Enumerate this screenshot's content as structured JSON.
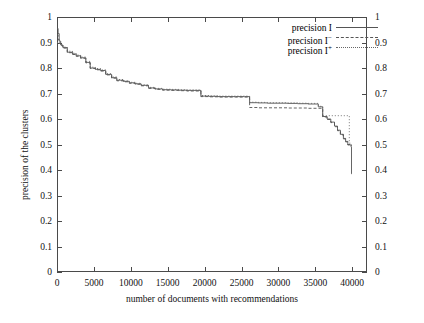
{
  "chart_data": {
    "type": "line",
    "title": "",
    "subtitle": "",
    "xlabel": "number of documents with recommendations",
    "ylabel": "precision of the clusters",
    "xlim": [
      0,
      42000
    ],
    "ylim": [
      0,
      1
    ],
    "xticks": [
      0,
      5000,
      10000,
      15000,
      20000,
      25000,
      30000,
      35000,
      40000
    ],
    "xtick_labels": [
      "0",
      "5000",
      "10000",
      "15000",
      "20000",
      "25000",
      "30000",
      "35000",
      "40000"
    ],
    "yticks": [
      0,
      0.1,
      0.2,
      0.3,
      0.4,
      0.5,
      0.6,
      0.7,
      0.8,
      0.9,
      1
    ],
    "ytick_labels": [
      "0",
      "0.1",
      "0.2",
      "0.3",
      "0.4",
      "0.5",
      "0.6",
      "0.7",
      "0.8",
      "0.9",
      "1"
    ],
    "right_axis_mirrored": true,
    "right_ytick_labels": [
      "0",
      "0.1",
      "0.2",
      "0.3",
      "0.4",
      "0.5",
      "0.6",
      "0.7",
      "0.8",
      "0.9",
      "1"
    ],
    "grid": false,
    "legend_position": "top-right",
    "step_style": "post",
    "series": [
      {
        "name": "precision I",
        "label_base": "precision I",
        "label_sup": "",
        "dash": "solid",
        "color": "#555555",
        "points": [
          [
            0,
            0.955
          ],
          [
            150,
            0.935
          ],
          [
            300,
            0.905
          ],
          [
            500,
            0.89
          ],
          [
            800,
            0.88
          ],
          [
            1400,
            0.862
          ],
          [
            2100,
            0.855
          ],
          [
            2600,
            0.848
          ],
          [
            3200,
            0.84
          ],
          [
            3900,
            0.822
          ],
          [
            4500,
            0.8
          ],
          [
            5200,
            0.795
          ],
          [
            5900,
            0.79
          ],
          [
            6600,
            0.775
          ],
          [
            7400,
            0.762
          ],
          [
            8100,
            0.752
          ],
          [
            9000,
            0.748
          ],
          [
            9800,
            0.742
          ],
          [
            10600,
            0.738
          ],
          [
            11400,
            0.732
          ],
          [
            12400,
            0.722
          ],
          [
            13300,
            0.718
          ],
          [
            14300,
            0.715
          ],
          [
            15400,
            0.714
          ],
          [
            16500,
            0.713
          ],
          [
            17600,
            0.712
          ],
          [
            18700,
            0.712
          ],
          [
            19500,
            0.69
          ],
          [
            20600,
            0.689
          ],
          [
            21800,
            0.688
          ],
          [
            23000,
            0.688
          ],
          [
            24200,
            0.688
          ],
          [
            25400,
            0.688
          ],
          [
            26100,
            0.664
          ],
          [
            27200,
            0.663
          ],
          [
            28500,
            0.662
          ],
          [
            29800,
            0.662
          ],
          [
            31200,
            0.661
          ],
          [
            32600,
            0.66
          ],
          [
            34000,
            0.659
          ],
          [
            35400,
            0.648
          ],
          [
            36000,
            0.61
          ],
          [
            36600,
            0.6
          ],
          [
            37100,
            0.588
          ],
          [
            37600,
            0.572
          ],
          [
            38000,
            0.556
          ],
          [
            38400,
            0.54
          ],
          [
            38800,
            0.524
          ],
          [
            39100,
            0.512
          ],
          [
            39400,
            0.5
          ],
          [
            39700,
            0.498
          ],
          [
            39850,
            0.49
          ],
          [
            39900,
            0.385
          ],
          [
            39950,
            0.385
          ]
        ]
      },
      {
        "name": "precision I-",
        "label_base": "precision I",
        "label_sup": "−",
        "dash": "dashed",
        "color": "#555555",
        "points": [
          [
            0,
            0.93
          ],
          [
            150,
            0.912
          ],
          [
            300,
            0.898
          ],
          [
            500,
            0.888
          ],
          [
            800,
            0.878
          ],
          [
            1400,
            0.86
          ],
          [
            2100,
            0.853
          ],
          [
            2600,
            0.846
          ],
          [
            3200,
            0.838
          ],
          [
            3900,
            0.82
          ],
          [
            4500,
            0.798
          ],
          [
            5200,
            0.793
          ],
          [
            5900,
            0.788
          ],
          [
            6600,
            0.773
          ],
          [
            7400,
            0.76
          ],
          [
            8100,
            0.75
          ],
          [
            9000,
            0.746
          ],
          [
            9800,
            0.74
          ],
          [
            10600,
            0.736
          ],
          [
            11400,
            0.73
          ],
          [
            12400,
            0.72
          ],
          [
            13300,
            0.716
          ],
          [
            14300,
            0.713
          ],
          [
            15400,
            0.712
          ],
          [
            16500,
            0.711
          ],
          [
            17600,
            0.71
          ],
          [
            18700,
            0.71
          ],
          [
            19500,
            0.688
          ],
          [
            20600,
            0.687
          ],
          [
            21800,
            0.686
          ],
          [
            23000,
            0.686
          ],
          [
            24200,
            0.686
          ],
          [
            25400,
            0.686
          ],
          [
            26100,
            0.645
          ],
          [
            27200,
            0.644
          ],
          [
            28500,
            0.644
          ],
          [
            29800,
            0.644
          ],
          [
            31200,
            0.643
          ],
          [
            32600,
            0.643
          ],
          [
            34000,
            0.642
          ],
          [
            35400,
            0.642
          ],
          [
            36000,
            0.608
          ],
          [
            36600,
            0.598
          ],
          [
            37100,
            0.586
          ],
          [
            37600,
            0.57
          ],
          [
            38000,
            0.554
          ],
          [
            38400,
            0.538
          ],
          [
            38800,
            0.522
          ],
          [
            39100,
            0.51
          ],
          [
            39400,
            0.498
          ],
          [
            39700,
            0.496
          ],
          [
            39900,
            0.494
          ]
        ]
      },
      {
        "name": "precision I+",
        "label_base": "precision I",
        "label_sup": "+",
        "dash": "dotted",
        "color": "#666666",
        "points": [
          [
            0,
            0.9
          ],
          [
            150,
            0.898
          ],
          [
            300,
            0.896
          ],
          [
            500,
            0.892
          ],
          [
            800,
            0.882
          ],
          [
            1400,
            0.866
          ],
          [
            2100,
            0.858
          ],
          [
            2600,
            0.851
          ],
          [
            3200,
            0.843
          ],
          [
            3900,
            0.826
          ],
          [
            4500,
            0.803
          ],
          [
            5200,
            0.798
          ],
          [
            5900,
            0.793
          ],
          [
            6600,
            0.778
          ],
          [
            7400,
            0.765
          ],
          [
            8100,
            0.755
          ],
          [
            9000,
            0.75
          ],
          [
            9800,
            0.744
          ],
          [
            10600,
            0.74
          ],
          [
            11400,
            0.734
          ],
          [
            12400,
            0.724
          ],
          [
            13300,
            0.72
          ],
          [
            14300,
            0.717
          ],
          [
            15400,
            0.716
          ],
          [
            16500,
            0.715
          ],
          [
            17600,
            0.714
          ],
          [
            18700,
            0.714
          ],
          [
            19500,
            0.692
          ],
          [
            20600,
            0.691
          ],
          [
            21800,
            0.69
          ],
          [
            23000,
            0.69
          ],
          [
            24200,
            0.69
          ],
          [
            25400,
            0.69
          ],
          [
            26100,
            0.666
          ],
          [
            27200,
            0.665
          ],
          [
            28500,
            0.664
          ],
          [
            29800,
            0.664
          ],
          [
            31200,
            0.663
          ],
          [
            32600,
            0.662
          ],
          [
            34000,
            0.661
          ],
          [
            35400,
            0.65
          ],
          [
            36000,
            0.613
          ],
          [
            36600,
            0.613
          ],
          [
            37100,
            0.613
          ],
          [
            37600,
            0.613
          ],
          [
            38000,
            0.613
          ],
          [
            38400,
            0.613
          ],
          [
            38800,
            0.613
          ],
          [
            39100,
            0.613
          ],
          [
            39400,
            0.613
          ],
          [
            39600,
            0.505
          ],
          [
            39900,
            0.5
          ]
        ]
      }
    ]
  },
  "legend": {
    "entries": [
      {
        "base": "precision I",
        "sup": ""
      },
      {
        "base": "precision I",
        "sup": "−"
      },
      {
        "base": "precision I",
        "sup": "+"
      }
    ]
  }
}
